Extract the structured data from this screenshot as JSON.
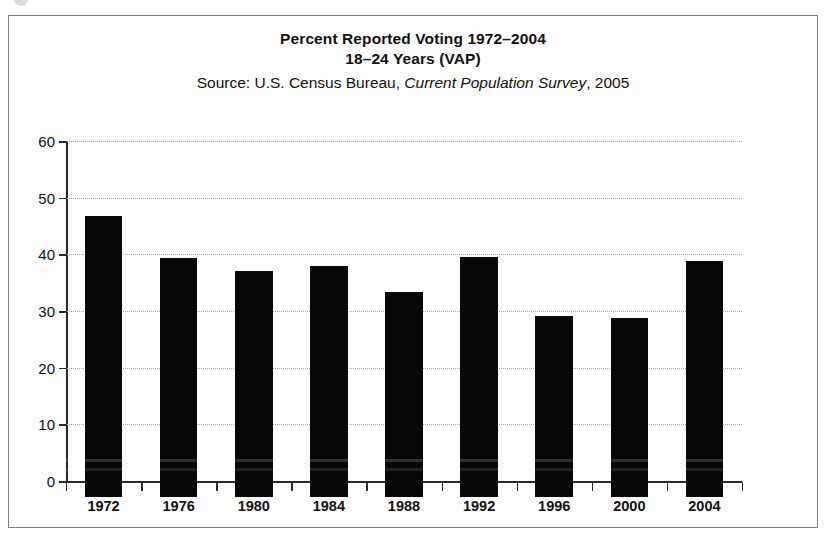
{
  "figure": {
    "title_line_1": "Percent Reported Voting 1972–2004",
    "title_line_2": "18–24 Years (VAP)",
    "source_prefix": "Source: U.S. Census Bureau, ",
    "source_italic": "Current Population Survey",
    "source_suffix": ", 2005"
  },
  "axes": {
    "y_ticks": [
      "0",
      "10",
      "20",
      "30",
      "40",
      "50",
      "60"
    ],
    "y_min": 0,
    "y_max": 60,
    "y_step": 10,
    "x_ticks": [
      "1972",
      "1976",
      "1980",
      "1984",
      "1988",
      "1992",
      "1996",
      "2000",
      "2004"
    ]
  },
  "colors": {
    "bar": "#080808",
    "axis": "#2a2a2a",
    "grid": "#a9a9ad",
    "frame": "#7d7d80",
    "background": "#fdfdfd",
    "text": "#111111"
  },
  "chart_data": {
    "type": "bar",
    "title": "Percent Reported Voting 1972–2004 18–24 Years (VAP)",
    "subtitle": "Source: U.S. Census Bureau, Current Population Survey, 2005",
    "xlabel": "",
    "ylabel": "",
    "categories": [
      "1972",
      "1976",
      "1980",
      "1984",
      "1988",
      "1992",
      "1996",
      "2000",
      "2004"
    ],
    "values": [
      49.6,
      42.2,
      39.9,
      40.8,
      36.2,
      42.4,
      31.9,
      31.6,
      41.6
    ],
    "ylim": [
      0,
      60
    ],
    "yticks": [
      0,
      10,
      20,
      30,
      40,
      50,
      60
    ],
    "grid": true,
    "legend": false,
    "series": [
      {
        "name": "Percent reported voting, ages 18–24 (VAP)",
        "values": [
          49.6,
          42.2,
          39.9,
          40.8,
          36.2,
          42.4,
          31.9,
          31.6,
          41.6
        ]
      }
    ]
  }
}
